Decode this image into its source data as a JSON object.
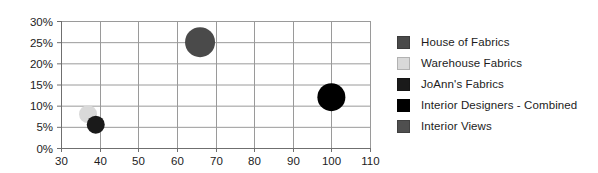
{
  "chart_data": {
    "type": "scatter",
    "title": "",
    "xlabel": "",
    "ylabel": "",
    "xlim": [
      30,
      110
    ],
    "ylim": [
      0,
      30
    ],
    "xticks": [
      30,
      40,
      50,
      60,
      70,
      80,
      90,
      100,
      110
    ],
    "xtick_labels": [
      "30",
      "40",
      "50",
      "60",
      "70",
      "80",
      "90",
      "100",
      "110"
    ],
    "yticks": [
      0,
      5,
      10,
      15,
      20,
      25,
      30
    ],
    "ytick_labels": [
      "0%",
      "5%",
      "10%",
      "15%",
      "20%",
      "25%",
      "30%"
    ],
    "grid": true,
    "legend_position": "right",
    "series": [
      {
        "name": "House of Fabrics",
        "color": "#4a4a4a",
        "points": [
          {
            "x": 66,
            "y": 25,
            "size": 30
          }
        ]
      },
      {
        "name": "Warehouse Fabrics",
        "color": "#d9d9d9",
        "points": [
          {
            "x": 37,
            "y": 8,
            "size": 18
          }
        ]
      },
      {
        "name": "JoAnn's Fabrics",
        "color": "#1a1a1a",
        "points": [
          {
            "x": 39,
            "y": 5.5,
            "size": 18
          }
        ]
      },
      {
        "name": "Interior Designers - Combined",
        "color": "#000000",
        "points": [
          {
            "x": 100,
            "y": 12,
            "size": 28
          }
        ]
      },
      {
        "name": "Interior Views",
        "color": "#4f4f4f",
        "points": []
      }
    ]
  },
  "legend": {
    "items": [
      {
        "label": "House of Fabrics",
        "color": "#4a4a4a"
      },
      {
        "label": "Warehouse Fabrics",
        "color": "#d9d9d9"
      },
      {
        "label": "JoAnn's Fabrics",
        "color": "#1a1a1a"
      },
      {
        "label": "Interior Designers - Combined",
        "color": "#000000"
      },
      {
        "label": "Interior Views",
        "color": "#4f4f4f"
      }
    ]
  },
  "axes": {
    "x_tick_labels": [
      "30",
      "40",
      "50",
      "60",
      "70",
      "80",
      "90",
      "100",
      "110"
    ],
    "y_tick_labels": [
      "0%",
      "5%",
      "10%",
      "15%",
      "20%",
      "25%",
      "30%"
    ]
  },
  "colors": {
    "grid": "#9a9a9a",
    "axis": "#6f6f6f",
    "tick_text": "#1c1c1c",
    "background": "#ffffff"
  }
}
